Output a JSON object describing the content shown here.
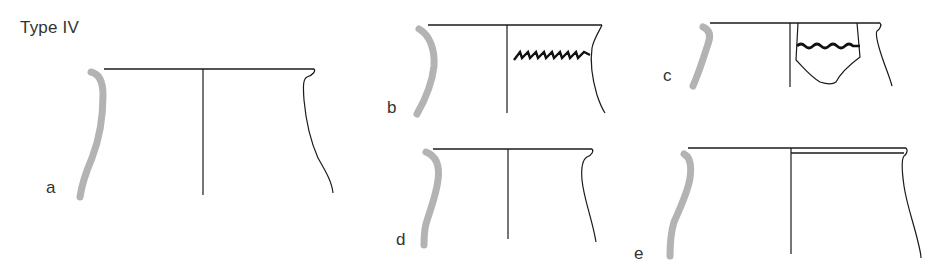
{
  "figure": {
    "title": "Type IV",
    "vessels": [
      {
        "id": "a",
        "label": "a",
        "decoration": "none"
      },
      {
        "id": "b",
        "label": "b",
        "decoration": "incised chevron/herringbone band on upper body"
      },
      {
        "id": "c",
        "label": "c",
        "decoration": "wavy impressed band on sherd fragment"
      },
      {
        "id": "d",
        "label": "d",
        "decoration": "none"
      },
      {
        "id": "e",
        "label": "e",
        "decoration": "none"
      }
    ],
    "colors": {
      "section": "#b3b3b3",
      "line": "#1a1a1a",
      "background": "#ffffff"
    }
  }
}
